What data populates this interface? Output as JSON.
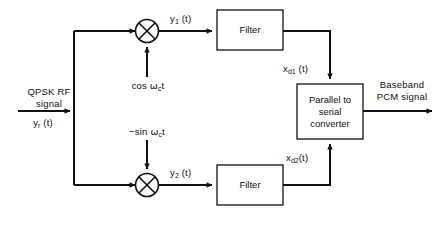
{
  "diagram": {
    "ink_color": "#111111",
    "background": "#ffffff",
    "input": {
      "name_line1": "QPSK RF",
      "name_line2": "signal",
      "signal_label_main": "y",
      "signal_label_sub": "r",
      "signal_label_tail": " (t)"
    },
    "carriers": {
      "inphase_pre": "cos ",
      "inphase_omega": "ω",
      "inphase_sub": "c",
      "inphase_post": "t",
      "quadrature_pre": "−sin ",
      "quadrature_omega": "ω",
      "quadrature_sub": "c",
      "quadrature_post": "t"
    },
    "mixers": [
      {
        "id": "mixer-upper",
        "symbol": "⊗"
      },
      {
        "id": "mixer-lower",
        "symbol": "⊗"
      }
    ],
    "mixer_outputs": {
      "upper_main": "y",
      "upper_sub": "1",
      "upper_tail": " (t)",
      "lower_main": "y",
      "lower_sub": "2",
      "lower_tail": " (t)"
    },
    "filters": {
      "upper_label": "Filter",
      "lower_label": "Filter"
    },
    "filter_outputs": {
      "upper_main": "x",
      "upper_sub": "d1",
      "upper_tail": " (t)",
      "lower_main": "x",
      "lower_sub": "d2",
      "lower_tail": "(t)"
    },
    "converter": {
      "line1": "Parallel to",
      "line2": "serial",
      "line3": "converter"
    },
    "output": {
      "line1": "Baseband",
      "line2": "PCM signal"
    }
  }
}
